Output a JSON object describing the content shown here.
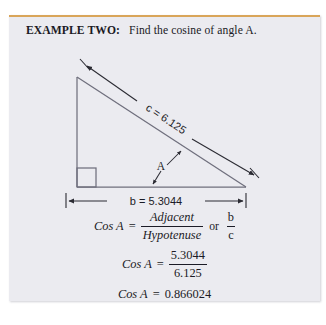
{
  "document": {
    "background_color": "#ffffff",
    "panel_color": "#ebebf0",
    "rule_color": "#d9a559",
    "ink_color": "#1b1b26"
  },
  "header": {
    "lead": "EXAMPLE TWO:",
    "rest": "Find the cosine of angle A."
  },
  "diagram": {
    "type": "right-triangle-with-dimensions",
    "hypotenuse_label": "c = 6.125",
    "base_label": "b = 5.3044",
    "angle_label": "A",
    "right_angle_marker": true,
    "vertices": {
      "top": [
        68,
        34
      ],
      "bottom_left": [
        68,
        144
      ],
      "bottom_right": [
        237,
        144
      ]
    },
    "hypotenuse_dimension": {
      "from": [
        74,
        20
      ],
      "to": [
        247,
        133
      ],
      "arrows": "both"
    },
    "base_dimension": {
      "from": [
        57,
        158
      ],
      "to": [
        237,
        158
      ],
      "arrows": "both"
    },
    "angle_arc_arrows": 2
  },
  "math": {
    "line1": {
      "lhs": "Cos A",
      "eq": "=",
      "num": "Adjacent",
      "den": "Hypotenuse",
      "connector": "or",
      "alt_num": "b",
      "alt_den": "c"
    },
    "line2": {
      "lhs": "Cos A",
      "eq": "=",
      "num": "5.3044",
      "den": "6.125"
    },
    "line3": {
      "lhs": "Cos A",
      "eq": "=",
      "value": "0.866024"
    }
  },
  "values": {
    "adjacent_b": "5.3044",
    "hypotenuse_c": "6.125",
    "cosine_result": "0.866024"
  }
}
